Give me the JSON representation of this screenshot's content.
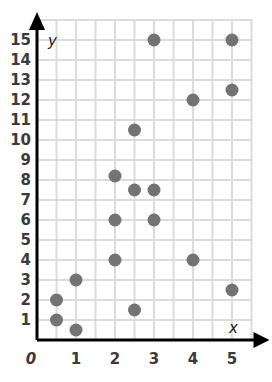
{
  "chart_data": {
    "type": "scatter",
    "title": "",
    "xlabel": "x",
    "ylabel": "y",
    "xlim": [
      0,
      5
    ],
    "ylim": [
      0,
      15
    ],
    "grid": true,
    "grid_step": 0.5,
    "x_ticks": [
      "0",
      "1",
      "2",
      "3",
      "4",
      "5"
    ],
    "y_ticks": [
      "1",
      "2",
      "3",
      "4",
      "5",
      "6",
      "7",
      "8",
      "9",
      "10",
      "11",
      "12",
      "13",
      "14",
      "15"
    ],
    "points": [
      {
        "x": 0.5,
        "y": 2
      },
      {
        "x": 0.5,
        "y": 1
      },
      {
        "x": 1,
        "y": 0.5
      },
      {
        "x": 1,
        "y": 3
      },
      {
        "x": 2,
        "y": 4
      },
      {
        "x": 2,
        "y": 6
      },
      {
        "x": 2,
        "y": 8.2
      },
      {
        "x": 2.5,
        "y": 7.5
      },
      {
        "x": 2.5,
        "y": 10.5
      },
      {
        "x": 2.5,
        "y": 1.5
      },
      {
        "x": 3,
        "y": 7.5
      },
      {
        "x": 3,
        "y": 6
      },
      {
        "x": 3,
        "y": 15
      },
      {
        "x": 4,
        "y": 12
      },
      {
        "x": 4,
        "y": 4
      },
      {
        "x": 5,
        "y": 15
      },
      {
        "x": 5,
        "y": 12.5
      },
      {
        "x": 5,
        "y": 2.5
      }
    ],
    "colors": {
      "point": "#737373",
      "grid": "#dcdcdc",
      "axis": "#000000",
      "tick_text": "#3a3a3a"
    }
  }
}
